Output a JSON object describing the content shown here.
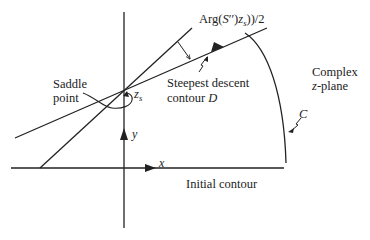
{
  "diagram": {
    "title_label": "Arg(S''(z_s))/2",
    "labels": {
      "arg_prefix": "Arg(",
      "arg_S": "S",
      "arg_primes": "′′",
      "arg_mid": ")",
      "arg_z": "z",
      "arg_sub": "s",
      "arg_suffix": "))/2",
      "saddle_line1": "Saddle",
      "saddle_line2": "point",
      "zs_z": "z",
      "zs_sub": "s",
      "steepest_line1": "Steepest descent",
      "steepest_line2_prefix": "contour ",
      "steepest_line2_var": "D",
      "complex_line1": "Complex",
      "complex_line2_var": "z",
      "complex_line2_suffix": "-plane",
      "contour_c": "C",
      "axis_x": "x",
      "axis_y": "y",
      "initial_contour": "Initial contour"
    },
    "colors": {
      "ink": "#222222",
      "background": "#ffffff"
    }
  }
}
